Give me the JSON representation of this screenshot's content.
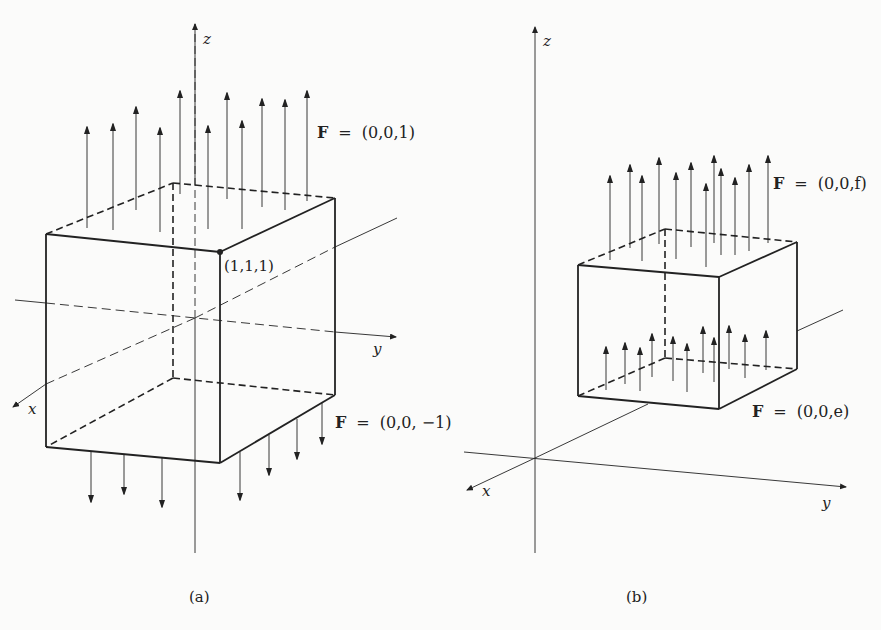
{
  "figure": {
    "panel_a": {
      "caption": "(a)",
      "axes": {
        "x": "x",
        "y": "y",
        "z": "z"
      },
      "corner_label": "(1,1,1)",
      "top_field": {
        "symbol": "F",
        "equals": "=",
        "value": "(0,0,1)"
      },
      "bottom_field": {
        "symbol": "F",
        "equals": "=",
        "value": "(0,0, −1)"
      },
      "top_arrow_count": 11,
      "bottom_arrow_count": 7
    },
    "panel_b": {
      "caption": "(b)",
      "axes": {
        "x": "x",
        "y": "y",
        "z": "z"
      },
      "top_field": {
        "symbol": "F",
        "equals": "=",
        "value": "(0,0,f)"
      },
      "bottom_field": {
        "symbol": "F",
        "equals": "=",
        "value": "(0,0,e)"
      },
      "top_arrow_count": 13,
      "bottom_arrow_count": 12
    },
    "colors": {
      "ink": "#222222",
      "background": "#fbfbfa"
    }
  }
}
